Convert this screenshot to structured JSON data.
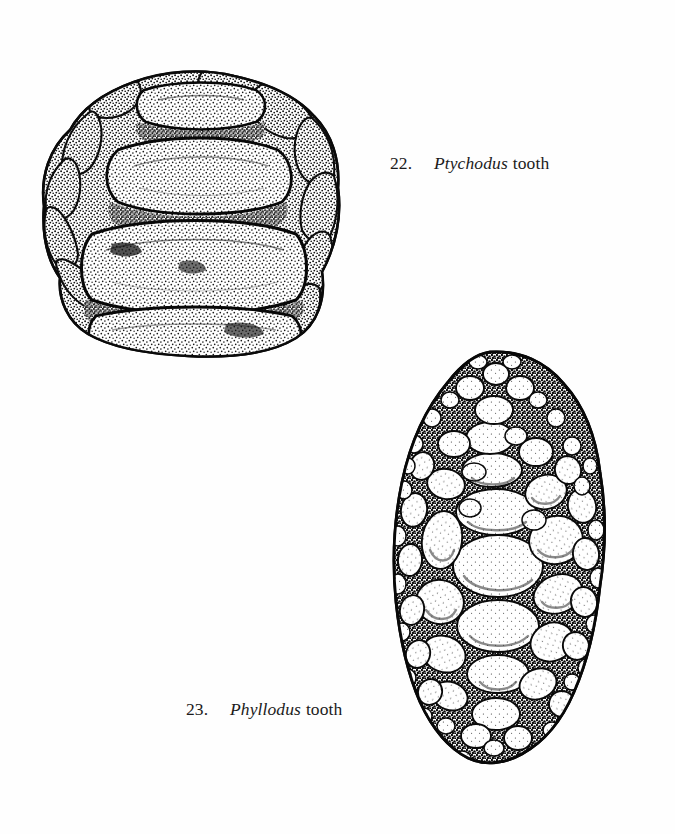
{
  "page": {
    "width": 675,
    "height": 834,
    "background_color": "#ffffff",
    "ink_color": "#111111",
    "medium": "stippled pen-and-ink scientific illustration",
    "content_type": "paleontology figure plate — fossil fish tooth morphology"
  },
  "figures": [
    {
      "id": "fig-22",
      "number": "22.",
      "genus": "Ptychodus",
      "common": "tooth",
      "caption_full": "22.   Ptychodus tooth",
      "position": "upper-left",
      "bounds": {
        "x": 38,
        "y": 45,
        "width": 302,
        "height": 305
      },
      "description": "Crushing tooth crown in occlusal view with transverse ridges and granular marginal border",
      "crown": {
        "ridge_count": 4,
        "ridge_orientation": "transverse-horizontal",
        "texture": "dense stipple",
        "ridges": [
          {
            "label": "ridge-1-posterior",
            "relative_width": 0.52,
            "relative_height": 0.12
          },
          {
            "label": "ridge-2",
            "relative_width": 0.7,
            "relative_height": 0.22
          },
          {
            "label": "ridge-3-median-largest",
            "relative_width": 0.8,
            "relative_height": 0.28
          },
          {
            "label": "ridge-4-anterior",
            "relative_width": 0.72,
            "relative_height": 0.2
          }
        ]
      },
      "margin": {
        "tubercle_count": 17,
        "tubercle_shape": "rounded bean-shaped lobes",
        "texture": "coarse granular stipple"
      }
    },
    {
      "id": "fig-23",
      "number": "23.",
      "genus": "Phyllodus",
      "common": "tooth",
      "caption_full": "23.   Phyllodus tooth",
      "position": "lower-right",
      "bounds": {
        "x": 393,
        "y": 352,
        "width": 219,
        "height": 433
      },
      "description": "Ovate pharyngeal tooth plate: mosaic of rounded denticles, largest medially, grading smaller toward the margins",
      "plate": {
        "outline_shape": "ovate, broadest below mid-height, lumpy irregular margin",
        "denticle_total_approx": 170,
        "denticle_shape": "oval to sub-circular, white with interior stipple arc",
        "matrix": "dark stippled interstitial tissue",
        "size_gradient": "large median row grading to fine marginal granules"
      }
    }
  ],
  "captions": [
    {
      "id": "caption-22",
      "number": "22.",
      "genus": "Ptychodus",
      "common": "tooth"
    },
    {
      "id": "caption-23",
      "number": "23.",
      "genus": "Phyllodus",
      "common": "tooth"
    }
  ]
}
